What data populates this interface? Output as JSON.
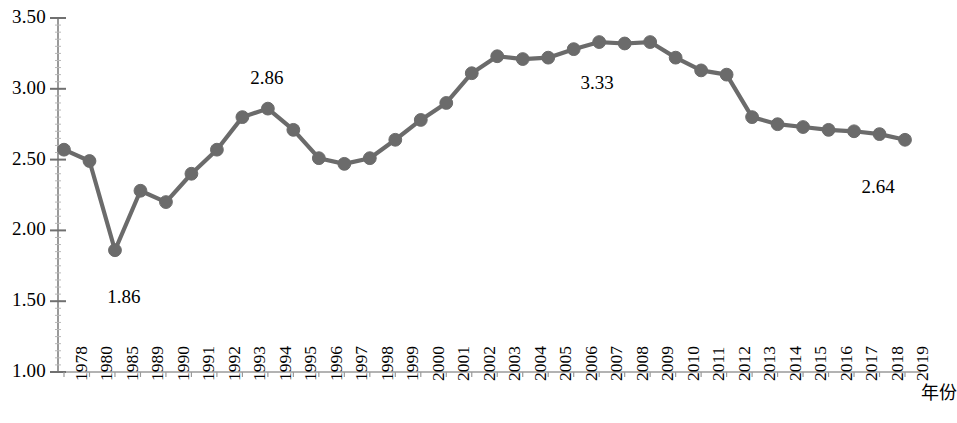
{
  "chart_data": {
    "type": "line",
    "title": "",
    "subtitle": "",
    "xlabel": "年份",
    "ylabel": "",
    "ylim": [
      1.0,
      3.5
    ],
    "ytick_step": 0.5,
    "grid": false,
    "legend": "none",
    "marker": "circle",
    "series_color": "#6b6b6b",
    "categories": [
      "1978",
      "1980",
      "1985",
      "1989",
      "1990",
      "1991",
      "1992",
      "1993",
      "1994",
      "1995",
      "1996",
      "1997",
      "1998",
      "1999",
      "2000",
      "2001",
      "2002",
      "2003",
      "2004",
      "2005",
      "2006",
      "2007",
      "2008",
      "2009",
      "2010",
      "2011",
      "2012",
      "2013",
      "2014",
      "2015",
      "2016",
      "2017",
      "2018",
      "2019"
    ],
    "values": [
      2.57,
      2.49,
      1.86,
      2.28,
      2.2,
      2.4,
      2.57,
      2.8,
      2.86,
      2.71,
      2.51,
      2.47,
      2.51,
      2.64,
      2.78,
      2.9,
      3.11,
      3.23,
      3.21,
      3.22,
      3.28,
      3.33,
      3.32,
      3.33,
      3.22,
      3.13,
      3.1,
      2.8,
      2.75,
      2.73,
      2.71,
      2.7,
      2.68,
      2.64
    ],
    "ytick_labels": [
      "1.00",
      "1.50",
      "2.00",
      "2.50",
      "3.00",
      "3.50"
    ],
    "ytick_values": [
      1.0,
      1.5,
      2.0,
      2.5,
      3.0,
      3.5
    ],
    "annotations": [
      {
        "text": "1.86",
        "category": "1985",
        "value": 1.86,
        "dx": 8,
        "dy": 48
      },
      {
        "text": "2.86",
        "category": "1994",
        "value": 2.86,
        "dx": -2,
        "dy": -30
      },
      {
        "text": "3.33",
        "category": "2007",
        "value": 3.33,
        "dx": -3,
        "dy": 42
      },
      {
        "text": "2.64",
        "category": "2019",
        "value": 2.64,
        "dx": -28,
        "dy": 48
      }
    ]
  }
}
